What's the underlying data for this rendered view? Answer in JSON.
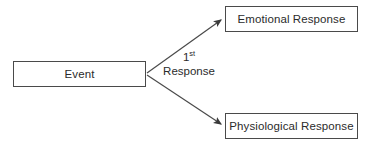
{
  "diagram": {
    "background_color": "#ffffff",
    "stroke_color": "#4a4a4a",
    "text_color": "#2b2b2b",
    "nodes": [
      {
        "id": "event",
        "label": "Event"
      },
      {
        "id": "emotional",
        "label": "Emotional Response"
      },
      {
        "id": "physiological",
        "label": "Physiological Response"
      }
    ],
    "edge_label": {
      "ordinal_number": "1",
      "ordinal_suffix": "st",
      "line2": "Response"
    },
    "edges": [
      {
        "from": "event",
        "to": "emotional",
        "style": "arrow"
      },
      {
        "from": "event",
        "to": "physiological",
        "style": "arrow"
      }
    ]
  }
}
